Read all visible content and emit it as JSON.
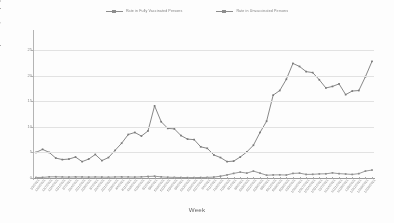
{
  "chart_data": {
    "type": "line",
    "title": "",
    "xlabel": "Week",
    "ylabel": "Rate per 100,000 population",
    "ylim": [
      0,
      26
    ],
    "yticks": [
      0,
      5,
      10,
      15,
      20,
      25
    ],
    "grid": true,
    "legend_position": "top-center",
    "categories": [
      "1/3/2021",
      "1/10/2021",
      "1/17/2021",
      "1/24/2021",
      "1/31/2021",
      "2/7/2021",
      "2/14/2021",
      "2/21/2021",
      "2/28/2021",
      "3/7/2021",
      "3/14/2021",
      "3/21/2021",
      "3/28/2021",
      "4/4/2021",
      "4/11/2021",
      "4/18/2021",
      "4/25/2021",
      "5/2/2021",
      "5/9/2021",
      "5/16/2021",
      "5/23/2021",
      "5/30/2021",
      "6/6/2021",
      "6/13/2021",
      "6/20/2021",
      "6/27/2021",
      "7/4/2021",
      "7/11/2021",
      "7/18/2021",
      "7/25/2021",
      "8/1/2021",
      "8/8/2021",
      "8/15/2021",
      "8/22/2021",
      "8/29/2021",
      "9/5/2021",
      "9/12/2021",
      "9/19/2021",
      "9/26/2021",
      "10/3/2021",
      "10/10/2021",
      "10/17/2021",
      "10/24/2021",
      "10/31/2021",
      "11/7/2021",
      "11/14/2021",
      "11/21/2021",
      "11/28/2021",
      "12/5/2021",
      "12/12/2021",
      "12/19/2021",
      "12/26/2021"
    ],
    "series": [
      {
        "name": "Rate in Fully Vaccinated Persons",
        "color": "#8d8d8d",
        "values": [
          0.1,
          0.12,
          0.22,
          0.24,
          0.2,
          0.18,
          0.22,
          0.2,
          0.18,
          0.2,
          0.18,
          0.16,
          0.2,
          0.22,
          0.2,
          0.18,
          0.22,
          0.3,
          0.35,
          0.22,
          0.15,
          0.12,
          0.1,
          0.08,
          0.08,
          0.1,
          0.12,
          0.18,
          0.35,
          0.6,
          0.9,
          1.15,
          0.95,
          1.35,
          0.95,
          0.55,
          0.6,
          0.62,
          0.58,
          0.9,
          0.95,
          0.7,
          0.72,
          0.8,
          0.82,
          1.0,
          0.85,
          0.78,
          0.7,
          0.85,
          1.35,
          1.55
        ]
      },
      {
        "name": "Rate in Unvaccinated Persons",
        "color": "#7a7a7a",
        "values": [
          5.0,
          5.6,
          5.0,
          3.9,
          3.6,
          3.7,
          4.1,
          3.2,
          3.7,
          4.6,
          3.4,
          4.0,
          5.4,
          6.8,
          8.5,
          8.9,
          8.2,
          9.2,
          14.1,
          11.0,
          9.7,
          9.6,
          8.3,
          7.6,
          7.5,
          6.1,
          5.8,
          4.5,
          4.0,
          3.2,
          3.3,
          4.1,
          5.1,
          6.4,
          8.9,
          11.1,
          16.2,
          17.1,
          19.3,
          22.4,
          21.8,
          20.8,
          20.6,
          19.2,
          17.6,
          17.9,
          18.4,
          16.3,
          17.0,
          17.1,
          19.8,
          22.8
        ]
      }
    ]
  },
  "legend": {
    "items": [
      {
        "label": "Rate in Fully Vaccinated Persons"
      },
      {
        "label": "Rate in Unvaccinated Persons"
      }
    ]
  },
  "axes": {
    "y_title": "Rate per 100,000 population",
    "x_title": "Week",
    "y_tick_labels": [
      "0",
      "5",
      "10",
      "15",
      "20",
      "25"
    ]
  }
}
